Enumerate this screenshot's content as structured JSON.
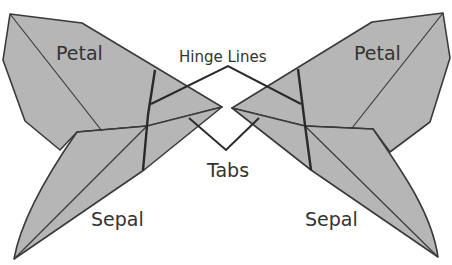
{
  "diagram": {
    "labels": {
      "left_petal": "Petal",
      "right_petal": "Petal",
      "left_sepal": "Sepal",
      "right_sepal": "Sepal",
      "hinge_lines": "Hinge Lines",
      "tabs": "Tabs"
    },
    "colors": {
      "shape_fill": "#b6b6b6",
      "outline": "#3a3a3a",
      "text": "#333333",
      "background": "#ffffff"
    }
  }
}
